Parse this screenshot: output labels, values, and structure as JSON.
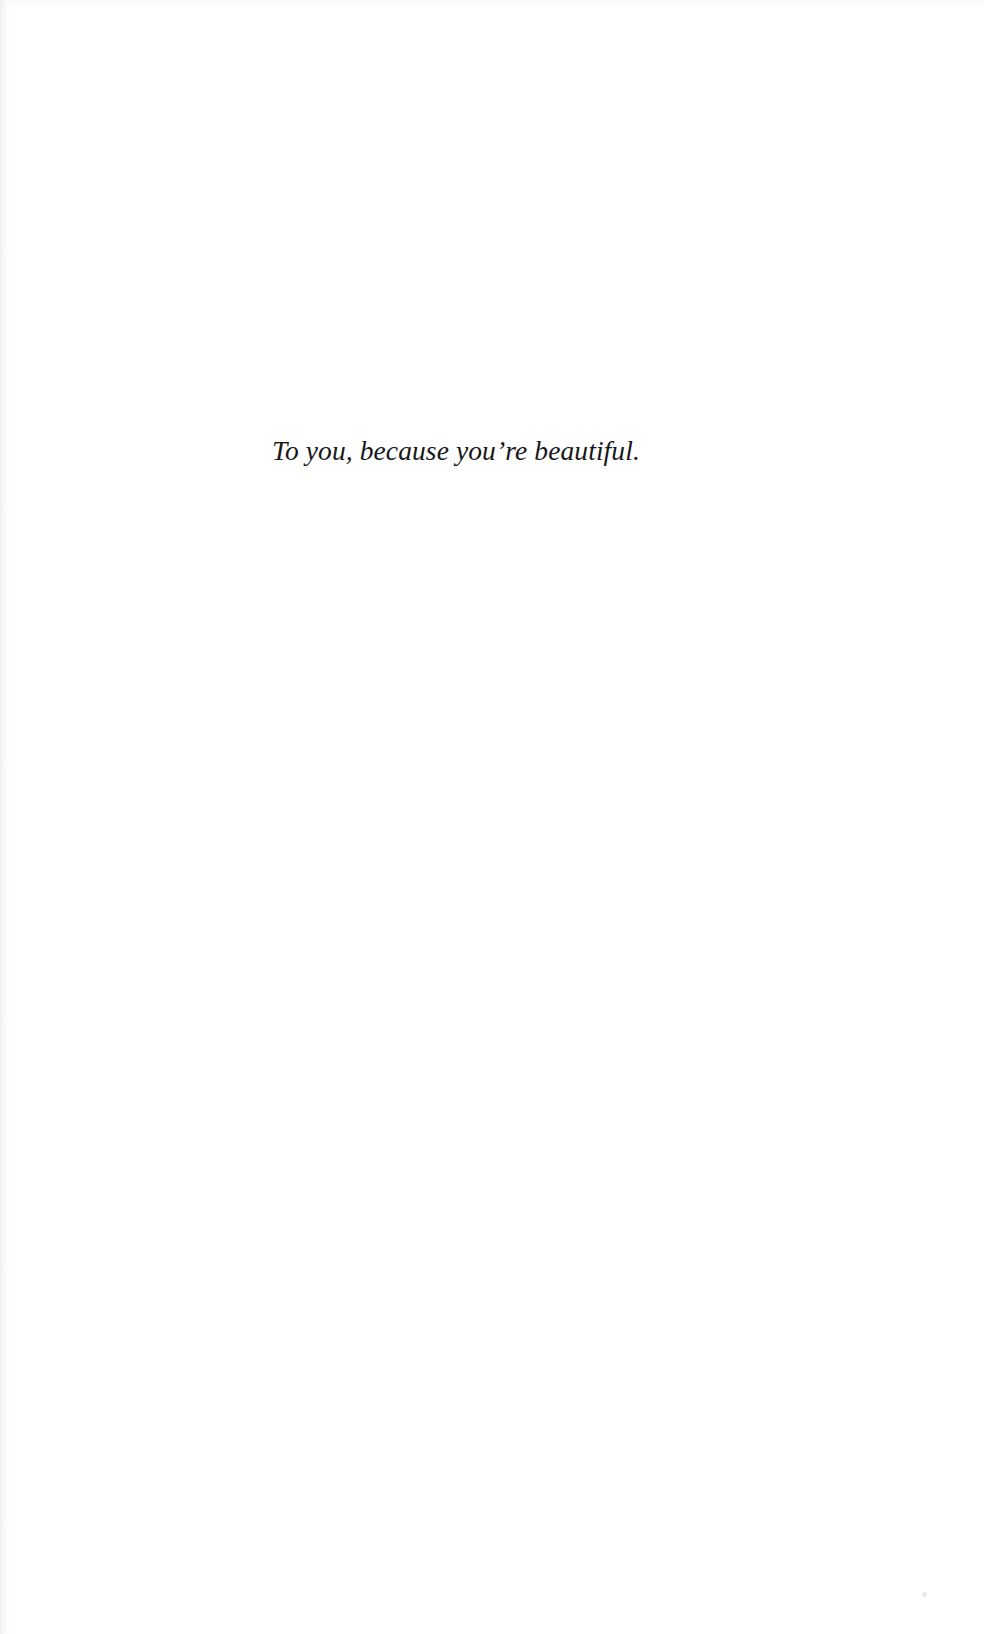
{
  "page": {
    "kind": "book-dedication-page",
    "background_color": "#ffffff",
    "text_color": "#17181a",
    "gutter_edge": "left",
    "width_px": 984,
    "height_px": 1634
  },
  "dedication": {
    "text": "To you, because you’re beautiful.",
    "style": "italic-serif",
    "alignment": "center"
  },
  "artifacts": {
    "gutter_shadow_label": "scan-gutter-shadow",
    "top_edge_label": "scan-top-edge-shadow",
    "speck_label": "scan-speck"
  }
}
